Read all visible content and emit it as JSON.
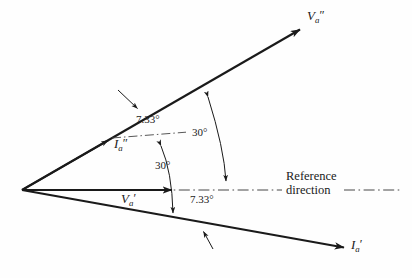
{
  "figure": {
    "type": "phasor-diagram",
    "background": "#ffffff",
    "line_color": "#1a1a1a",
    "origin": {
      "x": 22,
      "y": 190
    },
    "reference_axis": {
      "label_line1": "Reference",
      "label_line2": "direction",
      "style": "dash-dot",
      "from": {
        "x": 22,
        "y": 190
      },
      "to": {
        "x": 402,
        "y": 190
      }
    },
    "vectors": [
      {
        "id": "v-double-prime-a",
        "name": "V",
        "subscript": "a",
        "prime": "″",
        "label": "V″a",
        "angle_deg": 37.33,
        "style": "solid",
        "tip": {
          "x": 302,
          "y": 28
        },
        "label_pos": {
          "x": 309,
          "y": 12
        }
      },
      {
        "id": "i-double-prime-a",
        "name": "I",
        "subscript": "a",
        "prime": "″",
        "label": "I″a",
        "angle_deg": 30.0,
        "style": "solid-arrow-then-dash-dot",
        "tip": {
          "x": 110,
          "y": 139
        },
        "extension_tip": {
          "x": 185,
          "y": 133
        },
        "label_pos": {
          "x": 116,
          "y": 144
        }
      },
      {
        "id": "v-prime-a",
        "name": "V",
        "subscript": "a",
        "prime": "′",
        "label": "V′a",
        "angle_deg": 0.0,
        "style": "solid",
        "tip": {
          "x": 176,
          "y": 190
        },
        "label_pos": {
          "x": 122,
          "y": 193
        }
      },
      {
        "id": "i-prime-a",
        "name": "I",
        "subscript": "a",
        "prime": "′",
        "label": "I′a",
        "angle_deg": -7.33,
        "style": "solid",
        "tip": {
          "x": 346,
          "y": 248
        },
        "label_pos": {
          "x": 352,
          "y": 240
        }
      }
    ],
    "angle_annotations": [
      {
        "id": "angle-7-33-upper",
        "value": "7.33",
        "unit": "°",
        "text": "7.33°",
        "between": [
          "i-double-prime-a",
          "v-double-prime-a"
        ],
        "label_pos": {
          "x": 144,
          "y": 118
        }
      },
      {
        "id": "angle-30-upper",
        "value": "30",
        "unit": "°",
        "text": "30°",
        "between": [
          "reference-axis",
          "v-double-prime-a"
        ],
        "label_pos": {
          "x": 197,
          "y": 132
        }
      },
      {
        "id": "angle-30-lower",
        "value": "30",
        "unit": "°",
        "text": "30°",
        "between": [
          "reference-axis",
          "i-double-prime-a"
        ],
        "label_pos": {
          "x": 160,
          "y": 165
        }
      },
      {
        "id": "angle-7-33-lower",
        "value": "7.33",
        "unit": "°",
        "text": "7.33°",
        "between": [
          "reference-axis",
          "i-prime-a"
        ],
        "label_pos": {
          "x": 196,
          "y": 199
        }
      }
    ],
    "pointer_arrows": [
      {
        "id": "pointer-to-v-double-prime-line",
        "from": {
          "x": 119,
          "y": 91
        },
        "to": {
          "x": 137,
          "y": 108
        }
      },
      {
        "id": "pointer-to-i-prime-line",
        "from": {
          "x": 213,
          "y": 248
        },
        "to": {
          "x": 204,
          "y": 232
        }
      }
    ]
  }
}
